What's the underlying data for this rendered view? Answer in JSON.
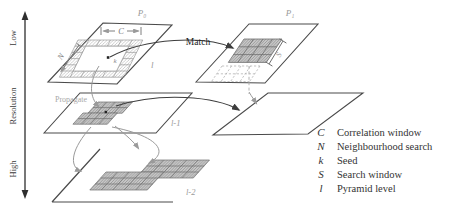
{
  "axis": {
    "label_low": "Low",
    "label_resolution": "Resolution",
    "label_high": "High"
  },
  "labels": {
    "p0": "P₀",
    "p1": "P₁",
    "match": "Match",
    "propagate": "Propagate",
    "correlation_c": "C",
    "neighbourhood_n": "N",
    "seed_k": "k",
    "search_s": "S",
    "level_l": "l",
    "level_l1": "l-1",
    "level_l2": "l-2"
  },
  "legend": {
    "items": [
      {
        "symbol": "C",
        "label": "Correlation window"
      },
      {
        "symbol": "N",
        "label": "Neighbourhood search"
      },
      {
        "symbol": "k",
        "label": "Seed"
      },
      {
        "symbol": "S",
        "label": "Search window"
      },
      {
        "symbol": "l",
        "label": "Pyramid level"
      }
    ]
  },
  "colors": {
    "ink": "#3d3d3d",
    "grey": "#9a9a9a",
    "grid_fill": "#c9c9c9"
  }
}
